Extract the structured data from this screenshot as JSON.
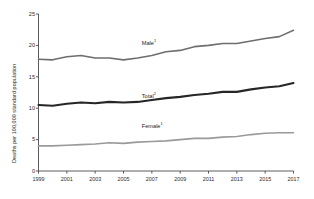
{
  "chart_data": {
    "type": "line",
    "title": "",
    "xlabel": "",
    "ylabel": "Deaths per 100,000 standard population",
    "x": [
      1999,
      2000,
      2001,
      2002,
      2003,
      2004,
      2005,
      2006,
      2007,
      2008,
      2009,
      2010,
      2011,
      2012,
      2013,
      2014,
      2015,
      2016,
      2017
    ],
    "xlim": [
      1999,
      2017
    ],
    "ylim": [
      0,
      25
    ],
    "xticks": [
      "1999",
      "2001",
      "2003",
      "2005",
      "2007",
      "2009",
      "2011",
      "2013",
      "2015",
      "2017"
    ],
    "xtick_values": [
      1999,
      2001,
      2003,
      2005,
      2007,
      2009,
      2011,
      2013,
      2015,
      2017
    ],
    "yticks": [
      "0",
      "5",
      "10",
      "15",
      "20",
      "25"
    ],
    "ytick_values": [
      0,
      5,
      10,
      15,
      20,
      25
    ],
    "grid": false,
    "legend_position": "inline-labels",
    "series": [
      {
        "name": "Male",
        "label": "Male",
        "footnote_marker": "1",
        "color": "#6e6e6e",
        "width": 1.6,
        "label_x": 2007,
        "label_y": 20.6,
        "values": [
          17.8,
          17.7,
          18.2,
          18.4,
          18.0,
          18.0,
          17.7,
          18.0,
          18.4,
          19.0,
          19.2,
          19.8,
          20.0,
          20.3,
          20.3,
          20.7,
          21.1,
          21.4,
          22.4
        ]
      },
      {
        "name": "Total",
        "label": "Total",
        "footnote_marker": "2",
        "color": "#262626",
        "width": 2.1,
        "label_x": 2007,
        "label_y": 12.1,
        "values": [
          10.5,
          10.4,
          10.7,
          10.9,
          10.8,
          11.0,
          10.9,
          11.0,
          11.3,
          11.6,
          11.8,
          12.1,
          12.3,
          12.6,
          12.6,
          13.0,
          13.3,
          13.5,
          14.0
        ]
      },
      {
        "name": "Female",
        "label": "Female",
        "footnote_marker": "1",
        "color": "#9a9a9a",
        "width": 1.6,
        "label_x": 2007,
        "label_y": 7.3,
        "values": [
          4.0,
          4.0,
          4.1,
          4.2,
          4.3,
          4.5,
          4.4,
          4.6,
          4.7,
          4.8,
          5.0,
          5.2,
          5.2,
          5.4,
          5.5,
          5.8,
          6.0,
          6.1,
          6.1
        ]
      }
    ]
  }
}
